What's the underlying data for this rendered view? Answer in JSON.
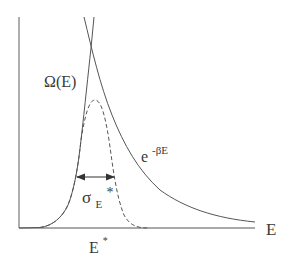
{
  "diagram": {
    "title": "",
    "colors": {
      "background": "#ffffff",
      "line": "#555555",
      "text": "#3a3a3a"
    },
    "axes": {
      "x_label": "E",
      "y_label": "",
      "origin_px": [
        19,
        228
      ],
      "x_end_px": 255,
      "y_top_px": 17
    },
    "labels": {
      "omega": "Ω(E)",
      "boltzmann_base": "e",
      "boltzmann_exp": "-βE",
      "sigma_base": "σ",
      "sigma_sub": "E",
      "sigma_star": "*",
      "estar_base": "E",
      "estar_sup": "*"
    },
    "curves": [
      {
        "name": "Omega(E)",
        "style": "solid",
        "description": "density of states, rising steeply from near zero"
      },
      {
        "name": "e^-betaE",
        "style": "solid",
        "description": "Boltzmann factor, decaying exponential"
      },
      {
        "name": "product",
        "style": "dashed",
        "description": "sharply peaked distribution at E*"
      }
    ],
    "annotations": [
      {
        "type": "double-arrow",
        "label": "σ_E*",
        "description": "width of peaked distribution"
      }
    ]
  }
}
